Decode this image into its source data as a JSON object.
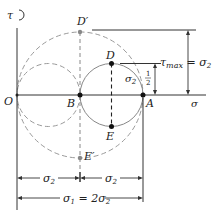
{
  "diagram": {
    "type": "Mohr's circle",
    "axes": {
      "horizontal_label": "σ",
      "vertical_label": "τ",
      "origin_label": "O"
    },
    "points": {
      "O": "O",
      "B": "B",
      "A": "A",
      "D": "D",
      "E": "E",
      "D_prime": "D′",
      "E_prime": "E′"
    },
    "annotations": {
      "tau_max": "τ",
      "tau_max_sub": "max",
      "tau_max_eq": " = σ",
      "tau_max_eq_sub": "2",
      "half_num": "1",
      "half_den": "2",
      "half_sigma": "σ",
      "half_sigma_sub": "2",
      "dim_sigma2_left": "σ",
      "dim_sigma2_left_sub": "2",
      "dim_sigma2_right": "σ",
      "dim_sigma2_right_sub": "2",
      "dim_sigma1": "σ",
      "dim_sigma1_sub": "1",
      "dim_sigma1_eq": " = 2σ",
      "dim_sigma1_eq_sub": "2"
    },
    "colors": {
      "line": "#333333",
      "dashed": "#999999",
      "circle": "#888888"
    }
  }
}
